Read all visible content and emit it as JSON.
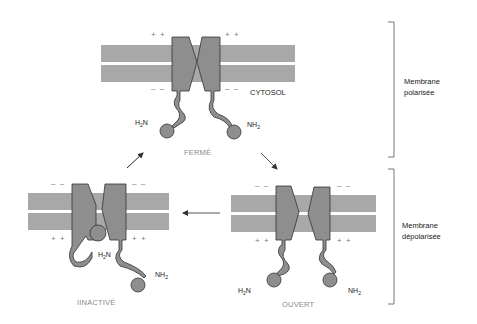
{
  "diagram": {
    "title": "",
    "compartment_label": "CYTOSOL",
    "states": {
      "closed": "FERMÉ",
      "open": "OUVERT",
      "inactive": "IINACTIVÉ"
    },
    "brackets": {
      "top": "Membrane polarisée",
      "top_line1": "Membrane",
      "top_line2": "polarisée",
      "bottom": "Membrane dépolarisée",
      "bottom_line1": "Membrane",
      "bottom_line2": "dépolarisée"
    },
    "charges": {
      "positive": "+ +",
      "negative": "– –"
    },
    "chem": {
      "amine_left_main": "H",
      "amine_left_sub": "2",
      "amine_left_end": "N",
      "amine_right_main": "NH",
      "amine_right_sub": "2"
    },
    "arrows": [
      {
        "from": "closed",
        "to": "open"
      },
      {
        "from": "open",
        "to": "inactive"
      },
      {
        "from": "inactive",
        "to": "closed"
      }
    ],
    "colors": {
      "membrane": "#a8a8a8",
      "protein": "#8e8e8e",
      "protein_stroke": "#333333",
      "arrow": "#333333"
    }
  }
}
